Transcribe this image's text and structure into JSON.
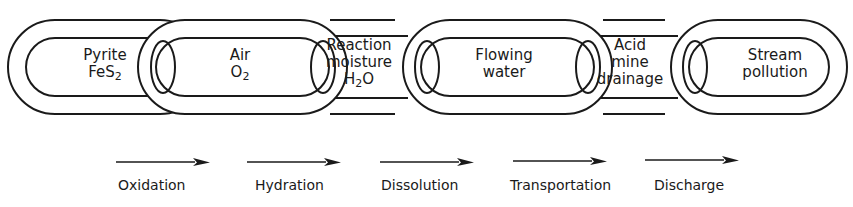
{
  "diagram": {
    "type": "chain-of-links",
    "stroke_color": "#1a1a1a",
    "background_color": "#ffffff",
    "links": [
      {
        "id": "pyrite",
        "lines": [
          "Pyrite",
          "FeS"
        ],
        "subscript": "2",
        "subscript_line": 1
      },
      {
        "id": "air",
        "lines": [
          "Air",
          "O"
        ],
        "subscript": "2",
        "subscript_line": 1
      },
      {
        "id": "reaction-moisture",
        "lines": [
          "Reaction",
          "moisture",
          "H"
        ],
        "subscript": "2",
        "subscript_line": 2,
        "suffix": "O"
      },
      {
        "id": "flowing-water",
        "lines": [
          "Flowing",
          "water"
        ]
      },
      {
        "id": "acid-mine-drainage",
        "lines": [
          "Acid",
          "mine",
          "drainage"
        ]
      },
      {
        "id": "stream-pollution",
        "lines": [
          "Stream",
          "pollution"
        ]
      }
    ],
    "processes": [
      {
        "id": "oxidation",
        "label": "Oxidation",
        "icon": "arrow-right-icon"
      },
      {
        "id": "hydration",
        "label": "Hydration",
        "icon": "arrow-right-icon"
      },
      {
        "id": "dissolution",
        "label": "Dissolution",
        "icon": "arrow-right-icon"
      },
      {
        "id": "transportation",
        "label": "Transportation",
        "icon": "arrow-right-icon"
      },
      {
        "id": "discharge",
        "label": "Discharge",
        "icon": "arrow-right-icon"
      }
    ]
  }
}
